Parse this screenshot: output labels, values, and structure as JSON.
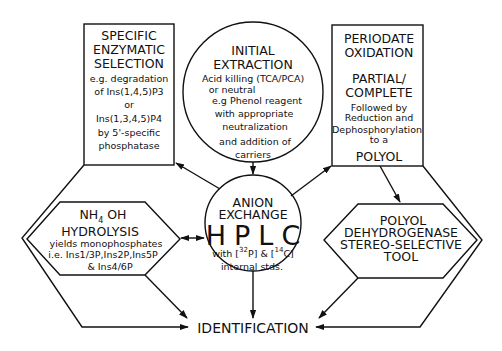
{
  "diagram": {
    "nodes": {
      "enzymatic": {
        "shape": "rectangle",
        "title": [
          "SPECIFIC",
          "ENZYMATIC",
          "SELECTION"
        ],
        "body": [
          "e.g. degradation",
          "of Ins(1,4,5)P3",
          "or",
          "Ins(1,3,4,5)P4",
          "by 5'-specific",
          "phosphatase"
        ]
      },
      "extraction": {
        "shape": "circle",
        "title": [
          "INITIAL",
          "EXTRACTION"
        ],
        "body": [
          "Acid killing (TCA/PCA)",
          "or neutral",
          "e.g Phenol reagent",
          "with appropriate",
          "neutralization",
          "and addition of",
          "carriers"
        ]
      },
      "periodate": {
        "shape": "rectangle",
        "title": [
          "PERIODATE",
          "OXIDATION"
        ],
        "subtitle": [
          "PARTIAL/",
          "COMPLETE"
        ],
        "body": [
          "Followed by",
          "Reduction and",
          "Dephosphorylation",
          "to a"
        ],
        "footer": "POLYOL"
      },
      "hplc": {
        "shape": "circle",
        "title": [
          "ANION",
          "EXCHANGE"
        ],
        "big": "HPLC",
        "body": [
          "with [32P] & [14C]",
          "internal stds."
        ],
        "sup1": "32",
        "sup2": "14",
        "line1a": "with [",
        "line1b": "P] & [",
        "line1c": "C]"
      },
      "hydrolysis": {
        "shape": "hexagon",
        "title_a": "NH",
        "title_sub": "4",
        "title_b": " OH",
        "title2": "HYDROLYSIS",
        "body": [
          "yields monophosphates",
          "i.e. Ins1/3P,Ins2P,Ins5P",
          "& Ins4/6P"
        ]
      },
      "dehydrogenase": {
        "shape": "hexagon",
        "title": [
          "POLYOL",
          "DEHYDROGENASE",
          "STEREO-SELECTIVE",
          "TOOL"
        ]
      },
      "identification": {
        "shape": "text",
        "label": "IDENTIFICATION"
      }
    },
    "edges": [
      {
        "from": "extraction",
        "to": "hplc"
      },
      {
        "from": "hplc",
        "to": "enzymatic"
      },
      {
        "from": "hplc",
        "to": "periodate"
      },
      {
        "from": "hplc",
        "to": "hydrolysis",
        "bidirectional": true
      },
      {
        "from": "hplc",
        "to": "identification"
      },
      {
        "from": "periodate",
        "to": "dehydrogenase"
      },
      {
        "from": "hydrolysis",
        "to": "identification"
      },
      {
        "from": "dehydrogenase",
        "to": "identification"
      },
      {
        "from": "enzymatic",
        "to": "identification",
        "via": "left outer path"
      },
      {
        "from": "periodate",
        "to": "identification",
        "via": "right outer path"
      }
    ]
  }
}
